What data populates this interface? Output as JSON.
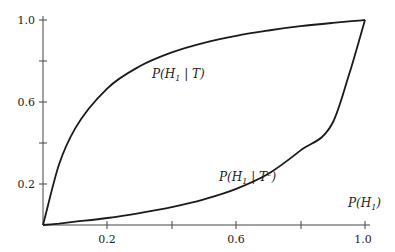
{
  "chart_data": {
    "type": "line",
    "title": "",
    "xlabel": "P(H1)",
    "ylabel": "",
    "xlim": [
      0,
      1
    ],
    "ylim": [
      0,
      1
    ],
    "grid": false,
    "legend": "none (inline curve labels)",
    "x_ticks": [
      0.2,
      0.4,
      0.6,
      0.8,
      1.0
    ],
    "x_tick_labels": [
      "0.2",
      "",
      "0.6",
      "",
      "1.0"
    ],
    "y_ticks": [
      0.2,
      0.4,
      0.6,
      0.8,
      1.0
    ],
    "y_tick_labels": [
      "0.2",
      "",
      "0.6",
      "",
      "1.0"
    ],
    "x": [
      0,
      0.05,
      0.1,
      0.2,
      0.3,
      0.4,
      0.5,
      0.6,
      0.7,
      0.8,
      0.9,
      0.95,
      1.0
    ],
    "series": [
      {
        "name": "P(H1 | T)",
        "values": [
          0,
          0.296,
          0.471,
          0.667,
          0.774,
          0.842,
          0.889,
          0.923,
          0.949,
          0.97,
          0.986,
          0.993,
          1.0
        ]
      },
      {
        "name": "P(H1 | T^c)",
        "values": [
          0,
          0.007,
          0.016,
          0.034,
          0.058,
          0.087,
          0.125,
          0.176,
          0.25,
          0.364,
          0.5,
          0.731,
          1.0
        ]
      }
    ],
    "annotations": [
      {
        "text": "P(H1 | T)",
        "near": [
          0.39,
          0.82
        ]
      },
      {
        "text": "P(H1 | T^c)",
        "near": [
          0.56,
          0.14
        ]
      },
      {
        "text": "P(H1)",
        "near": [
          0.97,
          0.05
        ]
      }
    ]
  },
  "labels": {
    "x_axis_label": "P(H",
    "x_axis_label_sub": "1",
    "x_axis_label_close": ")",
    "curve_upper": {
      "pre": "P(H",
      "sub": "1",
      "mid": " | T",
      "sup": "",
      "post": ")"
    },
    "curve_lower": {
      "pre": "P(H",
      "sub": "1",
      "mid": " | T",
      "sup": "c",
      "post": ")"
    },
    "x_ticks": [
      "0.2",
      "0.6",
      "1.0"
    ],
    "y_ticks": [
      "1.0",
      "0.6",
      "0.2"
    ]
  }
}
